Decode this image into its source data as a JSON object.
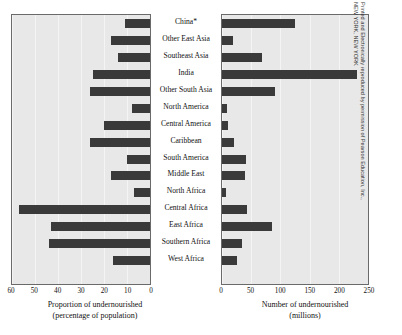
{
  "credit": {
    "line1": "Printed and Electronically reproduced by permission of Pearson Education, Inc.,",
    "line2": "NEW YORK, NEW YORK"
  },
  "left_axis": {
    "title_line1": "Proportion of undernourished",
    "title_line2": "(percentage of population)",
    "ticks": [
      "60",
      "50",
      "40",
      "30",
      "20",
      "10",
      "0"
    ]
  },
  "right_axis": {
    "title_line1": "Number of undernourished",
    "title_line2": "(millions)",
    "ticks": [
      "0",
      "50",
      "100",
      "150",
      "200",
      "250"
    ]
  },
  "chart_data": [
    {
      "type": "bar",
      "orientation": "horizontal",
      "direction": "right-to-left",
      "title": "",
      "xlabel": "Proportion of undernourished (percentage of population)",
      "ylabel": "",
      "xlim": [
        60,
        0
      ],
      "xticks": [
        60,
        50,
        40,
        30,
        20,
        10,
        0
      ],
      "grid": true,
      "legend": "none",
      "categories": [
        "China*",
        "Other East Asia",
        "Southeast Asia",
        "India",
        "Other South Asia",
        "North America",
        "Central America",
        "Caribbean",
        "South America",
        "Middle East",
        "North Africa",
        "Central Africa",
        "East Africa",
        "Southern Africa",
        "West Africa"
      ],
      "values": [
        11,
        17,
        14,
        25,
        26,
        8,
        20,
        26,
        10,
        17,
        7,
        57,
        43,
        44,
        16
      ]
    },
    {
      "type": "bar",
      "orientation": "horizontal",
      "direction": "left-to-right",
      "title": "",
      "xlabel": "Number of undernourished (millions)",
      "ylabel": "",
      "xlim": [
        0,
        250
      ],
      "xticks": [
        0,
        50,
        100,
        150,
        200,
        250
      ],
      "grid": true,
      "legend": "none",
      "categories": [
        "China*",
        "Other East Asia",
        "Southeast Asia",
        "India",
        "Other South Asia",
        "North America",
        "Central America",
        "Caribbean",
        "South America",
        "Middle East",
        "North Africa",
        "Central Africa",
        "East Africa",
        "Southern Africa",
        "West Africa"
      ],
      "values": [
        125,
        18,
        68,
        232,
        90,
        8,
        11,
        21,
        41,
        40,
        7,
        43,
        85,
        35,
        25
      ]
    }
  ],
  "colors": {
    "bar": "#3a3a3a",
    "plot_background": "#e8e8e8",
    "gridline": "#f4f4f4",
    "border": "#6a6a6a",
    "page_background": "#ffffff"
  }
}
